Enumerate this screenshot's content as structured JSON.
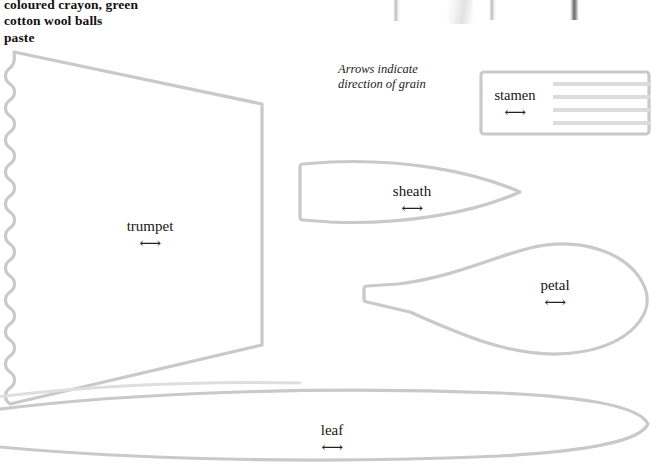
{
  "page": {
    "width": 651,
    "height": 470,
    "background_color": "#ffffff",
    "outline_color": "#c9c9c9",
    "strip_color": "#dcdcdc",
    "text_color": "#161616"
  },
  "materials": {
    "name": "materials-list",
    "lines": [
      "coloured crayon, green",
      "cotton wool balls",
      "paste"
    ]
  },
  "grain_note": {
    "name": "grain-direction-note",
    "lines": [
      "Arrows indicate",
      "direction of grain"
    ]
  },
  "arrow_glyph": "⟷",
  "pattern_pieces": [
    {
      "id": "trumpet",
      "label": "trumpet",
      "arrow": "⟷",
      "shape": "trapezoid-with-scalloped-left-edge"
    },
    {
      "id": "sheath",
      "label": "sheath",
      "arrow": "⟷",
      "shape": "pointed-leaf-flat-left-end"
    },
    {
      "id": "petal",
      "label": "petal",
      "arrow": "⟷",
      "shape": "teardrop-with-narrow-stem"
    },
    {
      "id": "leaf",
      "label": "leaf",
      "arrow": "⟷",
      "shape": "long-narrow-lens"
    },
    {
      "id": "stamen",
      "label": "stamen",
      "arrow": "⟷",
      "shape": "rectangle-with-fringe-strips",
      "strip_count": 4
    }
  ],
  "top_fragments": [
    {
      "id": "fragment-stick-1",
      "kind": "stick"
    },
    {
      "id": "fragment-paper",
      "kind": "paper"
    },
    {
      "id": "fragment-stick-2",
      "kind": "stick"
    },
    {
      "id": "fragment-stick-3",
      "kind": "dark-stick"
    }
  ]
}
